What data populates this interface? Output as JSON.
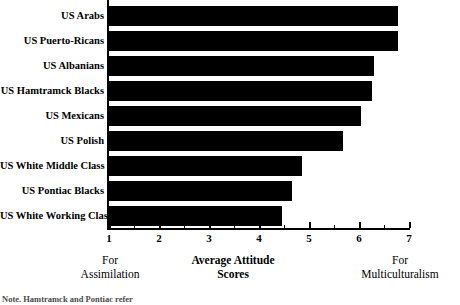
{
  "chart_data": {
    "type": "bar",
    "orientation": "horizontal",
    "title": "",
    "xlabel": "Average Attitude Scores",
    "ylabel": "",
    "xlim": [
      1,
      7
    ],
    "grid": false,
    "legend": null,
    "bar_color": "#000000",
    "categories": [
      "US Arabs",
      "US Puerto-Ricans",
      "US Albanians",
      "US Hamtramck Blacks",
      "US Mexicans",
      "US Polish",
      "US White Middle Class",
      "US Pontiac Blacks",
      "US White Working Class"
    ],
    "values": [
      6.78,
      6.78,
      6.3,
      6.26,
      6.04,
      5.68,
      4.86,
      4.66,
      4.46
    ],
    "xticks": [
      1,
      2,
      3,
      4,
      5,
      6,
      7
    ],
    "xticklabels": [
      "1",
      "2",
      "3",
      "4",
      "5",
      "6",
      "7"
    ],
    "minor_xticks": [
      1.5,
      2.5,
      3.5,
      4.5,
      5.5,
      6.5
    ],
    "annotations": {
      "left_anchor_line1": "For",
      "left_anchor_line2": "Assimilation",
      "center_label_line1": "Average Attitude",
      "center_label_line2": "Scores",
      "right_anchor_line1": "For",
      "right_anchor_line2": "Multiculturalism"
    }
  },
  "note": "Note. Hamtramck and Pontiac refer"
}
